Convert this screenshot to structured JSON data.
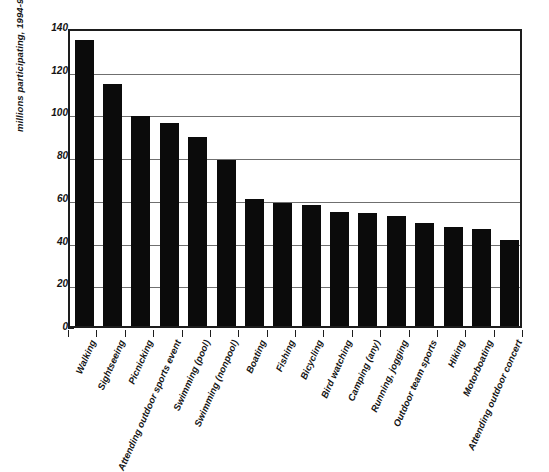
{
  "chart_data": {
    "type": "bar",
    "title": "",
    "xlabel": "",
    "ylabel": "millions participating, 1994-95",
    "ylim": [
      0,
      140
    ],
    "yticks": [
      0,
      20,
      40,
      60,
      80,
      100,
      120,
      140
    ],
    "ytick_labels": [
      "0",
      "20",
      "40",
      "60",
      "80",
      "100",
      "120",
      "140"
    ],
    "grid": true,
    "legend": "none",
    "bar_color": "#0b0b0b",
    "categories": [
      "Walking",
      "Sightseeing",
      "Picnicking",
      "Attending outdoor sports event",
      "Swimming (pool)",
      "Swimming (nonpool)",
      "Boating",
      "Fishing",
      "Bicycling",
      "Bird watching",
      "Camping (any)",
      "Running, jogging",
      "Outdoor team sports",
      "Hiking",
      "Motorboating",
      "Attending outdoor concert"
    ],
    "values": [
      133.7,
      113.4,
      98.5,
      95.2,
      88.3,
      77.6,
      59.5,
      57.8,
      56.6,
      53.5,
      52.8,
      51.6,
      48.2,
      46.5,
      45.5,
      40.2
    ]
  }
}
